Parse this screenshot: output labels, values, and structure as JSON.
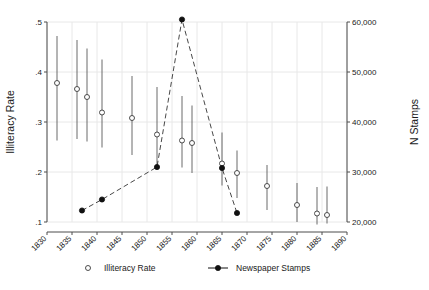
{
  "chart_data": {
    "type": "scatter",
    "title": "",
    "xlabel": "",
    "ylabel": "Illiteracy Rate",
    "y2label": "N Stamps",
    "xlim": [
      1830,
      1890
    ],
    "ylim": [
      0.1,
      0.5
    ],
    "y2lim": [
      20000,
      60000
    ],
    "xticks": [
      1830,
      1835,
      1840,
      1845,
      1850,
      1855,
      1860,
      1865,
      1870,
      1875,
      1880,
      1885,
      1890
    ],
    "xticklabels": [
      "1830",
      "1835",
      "1840",
      "1845",
      "1850",
      "1855",
      "1860",
      "1865",
      "1870",
      "1875",
      "1880",
      "1885",
      "1890"
    ],
    "yticks": [
      0.1,
      0.2,
      0.3,
      0.4,
      0.5
    ],
    "yticklabels": [
      ".1",
      ".2",
      ".3",
      ".4",
      ".5"
    ],
    "y2ticks": [
      20000,
      30000,
      40000,
      50000,
      60000
    ],
    "y2ticklabels": [
      "20,000",
      "30,000",
      "40,000",
      "50,000",
      "60,000"
    ],
    "grid": true,
    "legend_position": "bottom",
    "series": [
      {
        "name": "Illiteracy Rate",
        "marker": "open-circle",
        "axis": "left",
        "points": [
          {
            "x": 1832,
            "y": 0.378,
            "lo": 0.263,
            "hi": 0.472
          },
          {
            "x": 1836,
            "y": 0.366,
            "lo": 0.266,
            "hi": 0.464
          },
          {
            "x": 1838,
            "y": 0.35,
            "lo": 0.261,
            "hi": 0.447
          },
          {
            "x": 1841,
            "y": 0.319,
            "lo": 0.249,
            "hi": 0.425
          },
          {
            "x": 1847,
            "y": 0.308,
            "lo": 0.234,
            "hi": 0.392
          },
          {
            "x": 1852,
            "y": 0.275,
            "lo": 0.204,
            "hi": 0.37
          },
          {
            "x": 1857,
            "y": 0.263,
            "lo": 0.209,
            "hi": 0.352
          },
          {
            "x": 1859,
            "y": 0.258,
            "lo": 0.198,
            "hi": 0.333
          },
          {
            "x": 1865,
            "y": 0.217,
            "lo": 0.173,
            "hi": 0.279
          },
          {
            "x": 1868,
            "y": 0.198,
            "lo": 0.148,
            "hi": 0.243
          },
          {
            "x": 1874,
            "y": 0.172,
            "lo": 0.124,
            "hi": 0.214
          },
          {
            "x": 1880,
            "y": 0.134,
            "lo": 0.1,
            "hi": 0.178
          },
          {
            "x": 1884,
            "y": 0.117,
            "lo": 0.095,
            "hi": 0.17
          },
          {
            "x": 1886,
            "y": 0.114,
            "lo": 0.097,
            "hi": 0.171
          }
        ]
      },
      {
        "name": "Newspaper Stamps",
        "marker": "filled-circle",
        "axis": "right",
        "line": "dashed",
        "points": [
          {
            "x": 1837,
            "y": 22300
          },
          {
            "x": 1841,
            "y": 24500
          },
          {
            "x": 1852,
            "y": 31000
          },
          {
            "x": 1857,
            "y": 60500
          },
          {
            "x": 1865,
            "y": 30800
          },
          {
            "x": 1868,
            "y": 21800
          }
        ]
      }
    ],
    "legend": [
      {
        "label": "Illiteracy Rate",
        "marker": "open-circle"
      },
      {
        "label": "Newspaper Stamps",
        "marker": "filled-circle-line"
      }
    ]
  }
}
